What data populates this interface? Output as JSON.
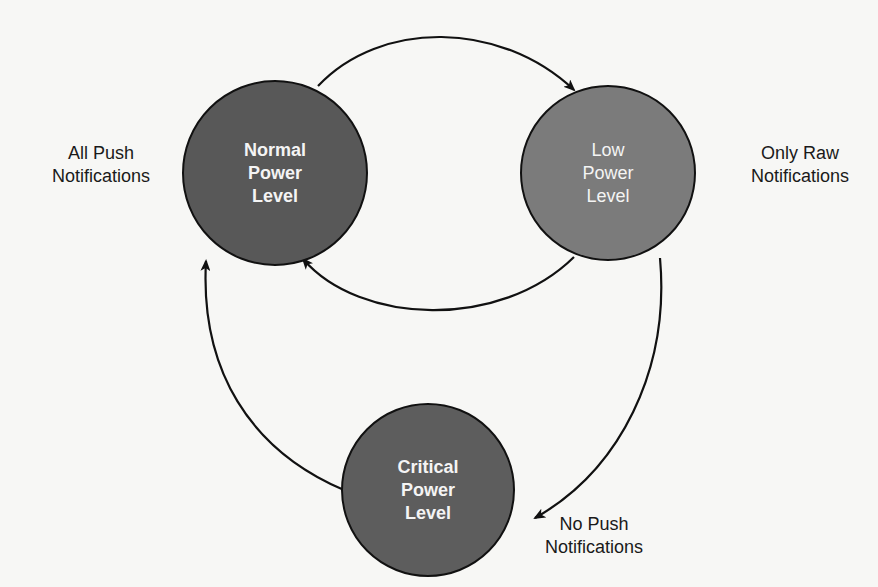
{
  "diagram": {
    "type": "state-transition",
    "colors": {
      "background": "#f7f7f5",
      "normal_fill": "#585858",
      "low_fill": "#7b7b7b",
      "critical_fill": "#5d5d5d",
      "stroke": "#111111",
      "node_text": "#f4f4f4",
      "label_text": "#1a1a1a"
    },
    "states": [
      {
        "id": "normal",
        "lines": [
          "Normal",
          "Power",
          "Level"
        ],
        "side_label": [
          "All Push",
          "Notifications"
        ]
      },
      {
        "id": "low",
        "lines": [
          "Low",
          "Power",
          "Level"
        ],
        "side_label": [
          "Only Raw",
          "Notifications"
        ]
      },
      {
        "id": "critical",
        "lines": [
          "Critical",
          "Power",
          "Level"
        ],
        "side_label": [
          "No Push",
          "Notifications"
        ]
      }
    ],
    "transitions": [
      {
        "from": "normal",
        "to": "low"
      },
      {
        "from": "low",
        "to": "normal"
      },
      {
        "from": "low",
        "to": "critical"
      },
      {
        "from": "critical",
        "to": "normal"
      }
    ]
  }
}
